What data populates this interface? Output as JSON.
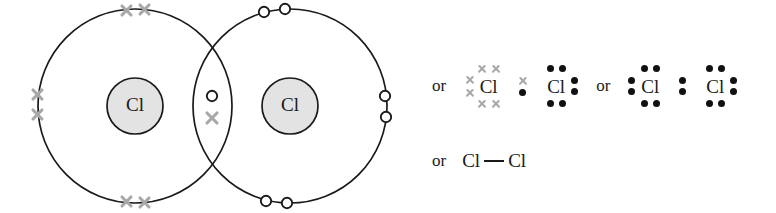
{
  "figure": {
    "type": "chemistry-bonding-diagram",
    "background_color": "#ffffff"
  },
  "colors": {
    "outline": "#1a1a1a",
    "nucleus_fill": "#e3e3e3",
    "electron_dot": "#111111",
    "electron_cross": "#a8a8a8",
    "text": "#1a1a1a"
  },
  "venn": {
    "left_atom": {
      "nucleus_label": "Cl",
      "electron_glyph": "cross",
      "shell_pairs": [
        {
          "position": "top",
          "glyph": "cross",
          "count": 2
        },
        {
          "position": "left",
          "glyph": "cross",
          "count": 2
        },
        {
          "position": "bottom",
          "glyph": "cross",
          "count": 2
        }
      ]
    },
    "right_atom": {
      "nucleus_label": "Cl",
      "electron_glyph": "open-circle",
      "shell_pairs": [
        {
          "position": "top",
          "glyph": "open-circle",
          "count": 2
        },
        {
          "position": "right",
          "glyph": "open-circle",
          "count": 2
        },
        {
          "position": "bottom",
          "glyph": "open-circle",
          "count": 2
        }
      ]
    },
    "shared_pair": {
      "description": "bonding pair in overlap lens",
      "upper_glyph": "open-circle",
      "lower_glyph": "cross",
      "count": 2
    }
  },
  "alternatives": {
    "or_label": "or",
    "dot_cross_structure": {
      "left_atom": {
        "symbol": "Cl",
        "glyph": "cross",
        "top_pair": 2,
        "left_pair": 2,
        "bottom_pair": 2
      },
      "right_atom": {
        "symbol": "Cl",
        "glyph": "dot",
        "top_pair": 2,
        "right_pair": 2,
        "bottom_pair": 2
      },
      "bond_pair": {
        "upper_glyph": "cross",
        "lower_glyph": "dot",
        "count": 2
      }
    },
    "all_dot_structure": {
      "left_atom": {
        "symbol": "Cl",
        "glyph": "dot",
        "top_pair": 2,
        "left_pair": 2,
        "bottom_pair": 2
      },
      "right_atom": {
        "symbol": "Cl",
        "glyph": "dot",
        "top_pair": 2,
        "right_pair": 2,
        "bottom_pair": 2
      },
      "bond_pair": {
        "upper_glyph": "dot",
        "lower_glyph": "dot",
        "count": 2
      }
    },
    "structural_formula": {
      "left_symbol": "Cl",
      "bond": "single",
      "right_symbol": "Cl"
    }
  }
}
